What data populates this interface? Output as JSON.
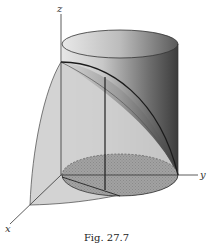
{
  "figure": {
    "type": "3d-solid-diagram",
    "axes": {
      "x_label": "x",
      "y_label": "y",
      "z_label": "z"
    },
    "caption": "Fig. 27.7",
    "colors": {
      "background": "#ffffff",
      "surface_light": "#d4d4d4",
      "surface_mid": "#b8b8b8",
      "cylinder_dark": "#4a4a4a",
      "base_region": "#9a9a9a",
      "lines": "#222222"
    }
  }
}
